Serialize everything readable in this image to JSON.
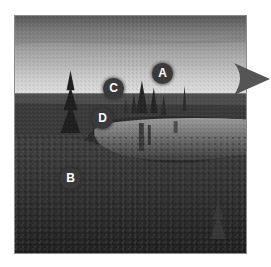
{
  "figure": {
    "markers": [
      {
        "id": "a",
        "label": "A"
      },
      {
        "id": "b",
        "label": "B"
      },
      {
        "id": "c",
        "label": "C"
      },
      {
        "id": "d",
        "label": "D"
      }
    ],
    "arrow_direction": "right",
    "colors": {
      "marker_fill": "#3a3a3a",
      "marker_text": "#ffffff",
      "arrow": "#555555",
      "frame": "#8a8a8a"
    }
  }
}
